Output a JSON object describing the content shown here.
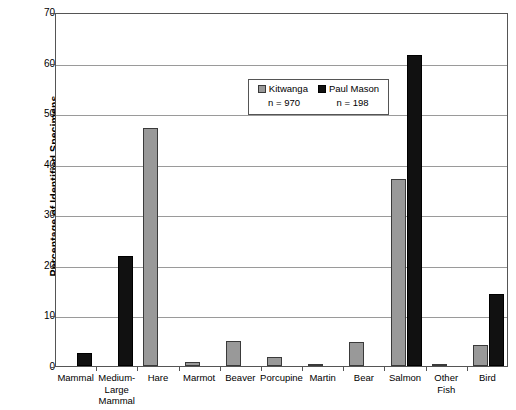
{
  "chart_data": {
    "type": "bar",
    "title": "",
    "xlabel": "",
    "ylabel": "Percentage of Identified Specimens",
    "ylim": [
      0,
      70
    ],
    "yticks": [
      0,
      10,
      20,
      30,
      40,
      50,
      60,
      70
    ],
    "grid": true,
    "legend_position": "inside-top-center",
    "categories": [
      "Mammal",
      "Medium-Large Mammal",
      "Hare",
      "Marmot",
      "Beaver",
      "Porcupine",
      "Martin",
      "Bear",
      "Salmon",
      "Other Fish",
      "Bird"
    ],
    "category_label_lines": [
      [
        "Mammal"
      ],
      [
        "Medium-",
        "Large",
        "Mammal"
      ],
      [
        "Hare"
      ],
      [
        "Marmot"
      ],
      [
        "Beaver"
      ],
      [
        "Porcupine"
      ],
      [
        "Martin"
      ],
      [
        "Bear"
      ],
      [
        "Salmon"
      ],
      [
        "Other",
        "Fish"
      ],
      [
        "Bird"
      ]
    ],
    "series": [
      {
        "name": "Kitwanga",
        "count_label": "n = 970",
        "color": "#999999",
        "values": [
          0,
          0,
          47.0,
          0.8,
          5.0,
          1.8,
          0.2,
          4.7,
          37.0,
          0.3,
          4.2
        ]
      },
      {
        "name": "Paul Mason",
        "count_label": "n = 198",
        "color": "#111111",
        "values": [
          2.6,
          21.7,
          0,
          0,
          0,
          0,
          0,
          0,
          61.5,
          0,
          14.2
        ]
      }
    ]
  },
  "legend": {
    "series_labels": [
      "Kitwanga",
      "Paul Mason"
    ],
    "counts": [
      "n = 970",
      "n = 198"
    ]
  },
  "axes": {
    "y_title": "Percentage of Identified Specimens",
    "y_tick_labels": [
      "0",
      "10",
      "20",
      "30",
      "40",
      "50",
      "60",
      "70"
    ]
  }
}
